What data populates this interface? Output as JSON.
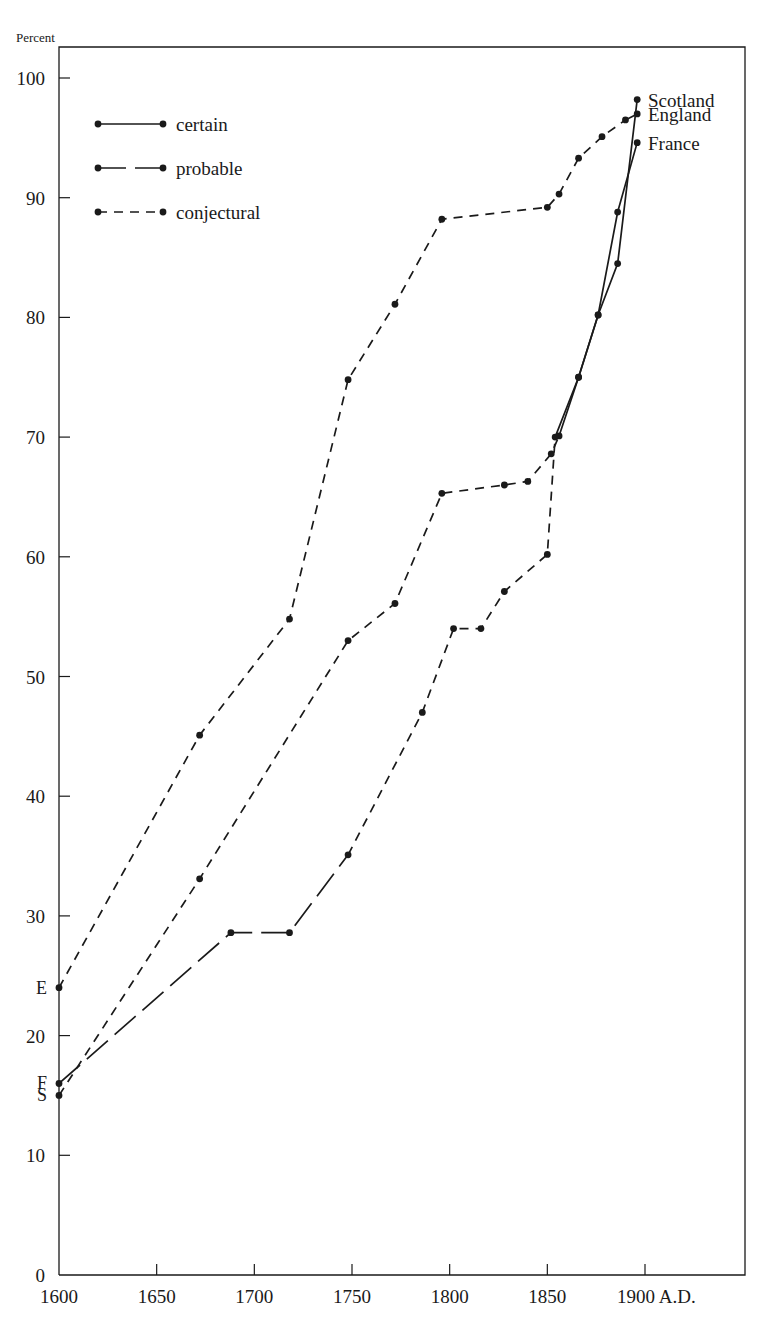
{
  "figure": {
    "y_axis_unit": "Percent",
    "x_axis_suffix": "A.D.",
    "background_color": "#ffffff",
    "ink_color": "#1a1a1a"
  },
  "legend": {
    "items": [
      {
        "label": "certain",
        "style": "solid",
        "dash": "none"
      },
      {
        "label": "probable",
        "style": "long-dash",
        "dash": "28 9"
      },
      {
        "label": "conjectural",
        "style": "short-dash",
        "dash": "9 7"
      }
    ]
  },
  "series_end_labels": [
    {
      "name": "Scotland",
      "value": 98.2
    },
    {
      "name": "England",
      "value": 97.0
    },
    {
      "name": "France",
      "value": 94.6
    }
  ],
  "series_start_labels": [
    {
      "name": "E",
      "series": "England",
      "value": 24.0
    },
    {
      "name": "F",
      "series": "France",
      "value": 16.0
    },
    {
      "name": "S",
      "series": "Scotland",
      "value": 15.0
    }
  ],
  "chart_data": {
    "type": "line",
    "title": "",
    "subtitle": "",
    "xlabel": "A.D.",
    "ylabel": "Percent",
    "xlim": [
      1600,
      1900
    ],
    "ylim": [
      0,
      100
    ],
    "xticks": [
      1600,
      1650,
      1700,
      1750,
      1800,
      1850,
      1900
    ],
    "xtick_labels": [
      "1600",
      "1650",
      "1700",
      "1750",
      "1800",
      "1850",
      "1900 A.D."
    ],
    "yticks": [
      0,
      10,
      20,
      30,
      40,
      50,
      60,
      70,
      80,
      90,
      100
    ],
    "ytick_labels": [
      "0",
      "10",
      "20",
      "30",
      "40",
      "50",
      "60",
      "70",
      "80",
      "90",
      "100"
    ],
    "grid": false,
    "legend_position": "upper-left",
    "series": [
      {
        "name": "England",
        "start_marker": "E",
        "end_marker": "England",
        "x": [
          1600,
          1672,
          1718,
          1748,
          1772,
          1796,
          1850,
          1856,
          1866,
          1878,
          1890,
          1896
        ],
        "y": [
          24.0,
          45.1,
          54.8,
          74.8,
          81.1,
          88.2,
          89.2,
          90.3,
          93.3,
          95.1,
          96.5,
          97.0
        ],
        "segments": [
          {
            "from_index": 0,
            "to_index": 10,
            "style": "conjectural",
            "dash": "9 7"
          },
          {
            "from_index": 10,
            "to_index": 11,
            "style": "certain",
            "dash": "none"
          }
        ]
      },
      {
        "name": "Scotland",
        "start_marker": "S",
        "end_marker": "Scotland",
        "x": [
          1600,
          1672,
          1748,
          1772,
          1796,
          1828,
          1840,
          1852,
          1856,
          1866,
          1876,
          1886,
          1896
        ],
        "y": [
          15.0,
          33.1,
          53.0,
          56.1,
          65.3,
          66.0,
          66.3,
          68.6,
          70.1,
          75.0,
          80.2,
          84.5,
          98.2
        ],
        "segments": [
          {
            "from_index": 0,
            "to_index": 8,
            "style": "conjectural",
            "dash": "9 7"
          },
          {
            "from_index": 8,
            "to_index": 12,
            "style": "certain",
            "dash": "none"
          }
        ]
      },
      {
        "name": "France",
        "start_marker": "F",
        "end_marker": "France",
        "x": [
          1600,
          1688,
          1718,
          1748,
          1786,
          1802,
          1816,
          1828,
          1850,
          1854,
          1866,
          1876,
          1886,
          1896
        ],
        "y": [
          16.0,
          28.6,
          28.6,
          35.1,
          47.0,
          54.0,
          54.0,
          57.1,
          60.2,
          70.0,
          75.0,
          80.2,
          88.8,
          94.6
        ],
        "segments": [
          {
            "from_index": 0,
            "to_index": 3,
            "style": "probable",
            "dash": "28 9"
          },
          {
            "from_index": 3,
            "to_index": 9,
            "style": "conjectural",
            "dash": "9 7"
          },
          {
            "from_index": 9,
            "to_index": 13,
            "style": "certain",
            "dash": "none"
          }
        ]
      }
    ]
  }
}
